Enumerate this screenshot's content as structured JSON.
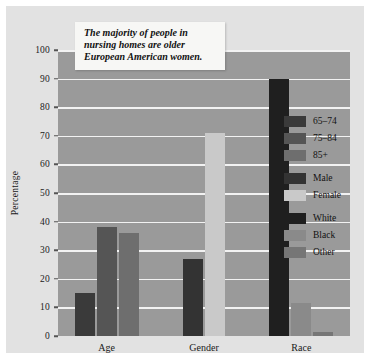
{
  "figure": {
    "background": "#e2e2e2",
    "plot_background": "#9a9a9a",
    "gridline_color": "#f2f2f2"
  },
  "callout": {
    "text": "The majority of people in nursing homes are older European American women."
  },
  "chart_data": {
    "type": "bar",
    "title": "",
    "xlabel": "",
    "ylabel": "Percentage",
    "ylim": [
      0,
      100
    ],
    "yticks": [
      0,
      10,
      20,
      30,
      40,
      50,
      60,
      70,
      80,
      90,
      100
    ],
    "grid": true,
    "legend_position": "right",
    "categories": [
      "Age",
      "Gender",
      "Race"
    ],
    "groups": [
      {
        "category": "Age",
        "bars": [
          {
            "label": "65–74",
            "value": 15,
            "color": "#3a3a3a"
          },
          {
            "label": "75–84",
            "value": 38,
            "color": "#555555"
          },
          {
            "label": "85+",
            "value": 36,
            "color": "#6e6e6e"
          }
        ]
      },
      {
        "category": "Gender",
        "bars": [
          {
            "label": "Male",
            "value": 27,
            "color": "#333333"
          },
          {
            "label": "Female",
            "value": 71,
            "color": "#c9c9c9"
          }
        ]
      },
      {
        "category": "Race",
        "bars": [
          {
            "label": "White",
            "value": 90,
            "color": "#1f1f1f"
          },
          {
            "label": "Black",
            "value": 11.5,
            "color": "#8a8a8a"
          },
          {
            "label": "Other",
            "value": 1.5,
            "color": "#767676"
          }
        ]
      }
    ],
    "legend": [
      {
        "label": "65–74",
        "color": "#3a3a3a",
        "group_start": true
      },
      {
        "label": "75–84",
        "color": "#555555",
        "group_start": false
      },
      {
        "label": "85+",
        "color": "#6e6e6e",
        "group_start": false
      },
      {
        "label": "Male",
        "color": "#333333",
        "group_start": true
      },
      {
        "label": "Female",
        "color": "#c9c9c9",
        "group_start": false
      },
      {
        "label": "White",
        "color": "#1f1f1f",
        "group_start": true
      },
      {
        "label": "Black",
        "color": "#8a8a8a",
        "group_start": false
      },
      {
        "label": "Other",
        "color": "#767676",
        "group_start": false
      }
    ]
  }
}
